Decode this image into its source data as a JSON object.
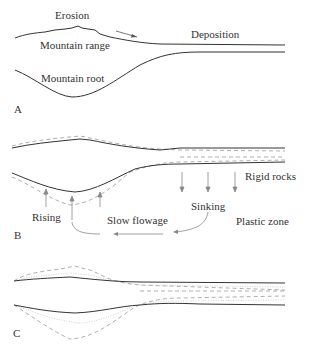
{
  "figure": {
    "panels": [
      {
        "id": "A",
        "labels": {
          "erosion": "Erosion",
          "mountain_range": "Mountain range",
          "deposition": "Deposition",
          "mountain_root": "Mountain root"
        }
      },
      {
        "id": "B",
        "labels": {
          "rigid_rocks": "Rigid rocks",
          "rising": "Rising",
          "sinking": "Sinking",
          "slow_flowage": "Slow flowage",
          "plastic_zone": "Plastic zone"
        }
      },
      {
        "id": "C",
        "labels": {}
      }
    ],
    "colors": {
      "solid_line": "#333333",
      "dashed_line": "#999999",
      "dotted_line": "#bbbbbb",
      "arrow": "#888888",
      "text": "#333333"
    }
  }
}
